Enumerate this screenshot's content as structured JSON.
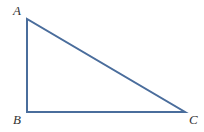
{
  "figure": {
    "kind": "right-triangle-diagram",
    "background_color": "#ffffff",
    "stroke_color": "#4a6d9c",
    "stroke_width": 2,
    "label_color": "#333333",
    "right_angle_vertex": "B",
    "vertices": [
      {
        "id": "A",
        "label": "A",
        "x": 27,
        "y": 19
      },
      {
        "id": "B",
        "label": "B",
        "x": 27,
        "y": 112
      },
      {
        "id": "C",
        "label": "C",
        "x": 185,
        "y": 112
      }
    ],
    "edges": [
      {
        "id": "AB",
        "from": "A",
        "to": "B"
      },
      {
        "id": "BC",
        "from": "B",
        "to": "C"
      },
      {
        "id": "CA",
        "from": "C",
        "to": "A"
      }
    ],
    "polygon_points": "27,19 27,112 185,112"
  }
}
